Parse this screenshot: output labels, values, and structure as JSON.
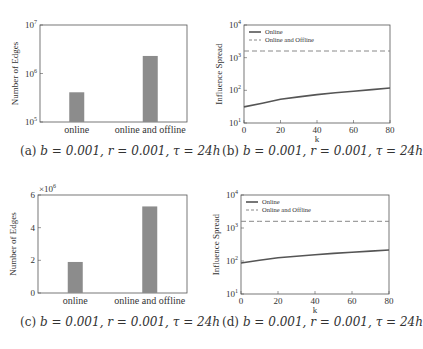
{
  "chart_data": [
    {
      "id": "a",
      "type": "bar",
      "caption": "(a) b = 0.001, r = 0.001, τ = 24h",
      "caption_label": "(a)",
      "categories": [
        "online",
        "online and offline"
      ],
      "values": [
        410000,
        2300000
      ],
      "ylabel": "Number of Edges",
      "xlabel": "",
      "yscale": "log",
      "ylim": [
        100000,
        10000000
      ],
      "ytick_labels": [
        "10^5",
        "10^6",
        "10^7"
      ],
      "grid": false,
      "bar_color": "#8c8c8c"
    },
    {
      "id": "b",
      "type": "line",
      "caption": "(b) b = 0.001, r = 0.001, τ = 24h",
      "caption_label": "(b)",
      "x": [
        0,
        10,
        20,
        30,
        40,
        50,
        60,
        70,
        80
      ],
      "series": [
        {
          "name": "Online",
          "style": "solid",
          "color": "#555555",
          "values": [
            31,
            40,
            53,
            63,
            74,
            84,
            94,
            105,
            118
          ]
        },
        {
          "name": "Online and Offline",
          "style": "dashed",
          "color": "#888888",
          "values": [
            1600,
            1600,
            1600,
            1600,
            1600,
            1600,
            1600,
            1600,
            1600
          ]
        }
      ],
      "xlabel": "k",
      "ylabel": "Influence Spread",
      "yscale": "log",
      "xlim": [
        0,
        80
      ],
      "ylim": [
        10,
        10000
      ],
      "xtick_labels": [
        "0",
        "20",
        "40",
        "60",
        "80"
      ],
      "ytick_labels": [
        "10^1",
        "10^2",
        "10^3",
        "10^4"
      ],
      "legend_position": "upper left",
      "grid": false
    },
    {
      "id": "c",
      "type": "bar",
      "caption": "(c) b = 0.001, r = 0.001, τ = 24h",
      "caption_label": "(c)",
      "categories": [
        "online",
        "online and offline"
      ],
      "values": [
        1900000,
        5300000
      ],
      "ylabel": "Number of Edges",
      "xlabel": "",
      "yscale": "linear",
      "ylim": [
        0,
        6000000
      ],
      "ytick_labels": [
        "0",
        "2",
        "4",
        "6"
      ],
      "y_multiplier": "×10^6",
      "grid": false,
      "bar_color": "#8c8c8c"
    },
    {
      "id": "d",
      "type": "line",
      "caption": "(d) b = 0.001, r = 0.001, τ = 24h",
      "caption_label": "(d)",
      "x": [
        0,
        10,
        20,
        30,
        40,
        50,
        60,
        70,
        80
      ],
      "series": [
        {
          "name": "Online",
          "style": "solid",
          "color": "#555555",
          "values": [
            87,
            105,
            125,
            140,
            155,
            170,
            185,
            200,
            215
          ]
        },
        {
          "name": "Online and Offline",
          "style": "dashed",
          "color": "#888888",
          "values": [
            1600,
            1600,
            1600,
            1600,
            1600,
            1600,
            1600,
            1600,
            1600
          ]
        }
      ],
      "xlabel": "k",
      "ylabel": "Influence Spread",
      "yscale": "log",
      "xlim": [
        0,
        80
      ],
      "ylim": [
        10,
        10000
      ],
      "xtick_labels": [
        "0",
        "20",
        "40",
        "60",
        "80"
      ],
      "ytick_labels": [
        "10^1",
        "10^2",
        "10^3",
        "10^4"
      ],
      "legend_position": "upper left",
      "grid": false
    }
  ],
  "captions": {
    "a": {
      "label": "(a)",
      "params": "b = 0.001, r = 0.001, τ = 24h"
    },
    "b": {
      "label": "(b)",
      "params": "b = 0.001, r = 0.001, τ = 24h"
    },
    "c": {
      "label": "(c)",
      "params": "b = 0.001, r = 0.001, τ = 24h"
    },
    "d": {
      "label": "(d)",
      "params": "b = 0.001, r = 0.001, τ = 24h"
    }
  }
}
